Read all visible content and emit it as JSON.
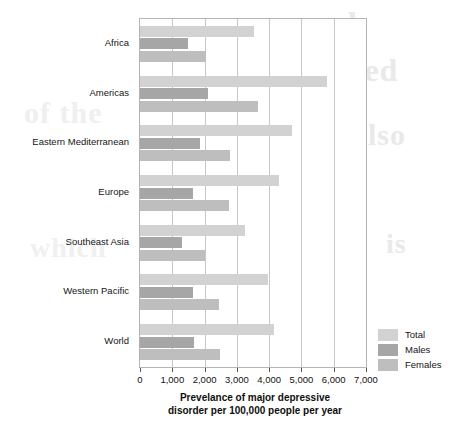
{
  "chart_data": {
    "type": "bar",
    "orientation": "horizontal",
    "title": "",
    "xlabel": "Prevelance of major depressive disorder per 100,000 people per year",
    "xlabel_line1": "Prevelance of major depressive",
    "xlabel_line2": "disorder per 100,000 people per year",
    "ylabel": "",
    "xlim": [
      0,
      7000
    ],
    "xtick_values": [
      0,
      1000,
      2000,
      3000,
      4000,
      5000,
      6000,
      7000
    ],
    "xtick_labels": [
      "0",
      "1,000",
      "2,000",
      "3,000",
      "4,000",
      "5,000",
      "6,000",
      "7,000"
    ],
    "grid": "vertical",
    "legend_position": "bottom-right",
    "categories": [
      "Africa",
      "Americas",
      "Eastern Mediterranean",
      "Europe",
      "Southeast Asia",
      "Western Pacific",
      "World"
    ],
    "series": [
      {
        "name": "Total",
        "color": "#d2d2d2",
        "values": [
          3540,
          5800,
          4700,
          4300,
          3250,
          3950,
          4150
        ]
      },
      {
        "name": "Males",
        "color": "#a6a6a6",
        "values": [
          1480,
          2100,
          1850,
          1650,
          1300,
          1650,
          1680
        ]
      },
      {
        "name": "Females",
        "color": "#bebebe",
        "values": [
          2050,
          3650,
          2800,
          2750,
          2000,
          2450,
          2480
        ]
      }
    ]
  },
  "legend": {
    "items": [
      {
        "label": "Total",
        "color": "#d2d2d2"
      },
      {
        "label": "Males",
        "color": "#a6a6a6"
      },
      {
        "label": "Females",
        "color": "#bebebe"
      }
    ]
  },
  "ghost_text": {
    "a": "and",
    "b": "related",
    "c": "of the",
    "d": "also",
    "e": "which",
    "f": "is"
  }
}
